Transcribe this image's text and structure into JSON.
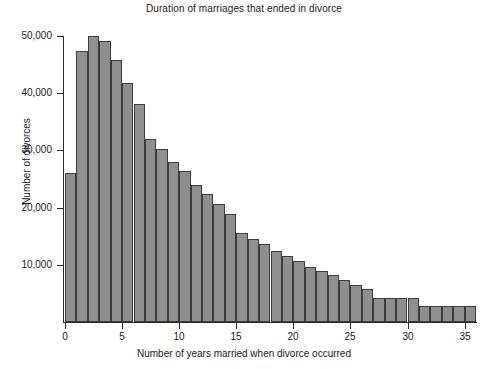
{
  "chart_data": {
    "type": "bar",
    "title": "Duration of marriages that ended in divorce",
    "xlabel": "Number of years married when divorce occurred",
    "ylabel": "Number of divorces",
    "grid": false,
    "legend": null,
    "xlim": [
      0,
      36
    ],
    "ylim": [
      0,
      50000
    ],
    "bin_width": 1,
    "x_ticks": [
      0,
      5,
      10,
      15,
      20,
      25,
      30,
      35
    ],
    "x_tick_labels": [
      "0",
      "5",
      "10",
      "15",
      "20",
      "25",
      "30",
      "35"
    ],
    "y_ticks": [
      10000,
      20000,
      30000,
      40000,
      50000
    ],
    "y_tick_labels": [
      "10,000",
      "20,000",
      "30,000",
      "40,000",
      "50,000"
    ],
    "bar_color": "#8f8f8f",
    "bar_edge_color": "#3c3c3c",
    "axis_color": "#2b2b2b",
    "background_color": "#ffffff",
    "categories": [
      "0-1",
      "1-2",
      "2-3",
      "3-4",
      "4-5",
      "5-6",
      "6-7",
      "7-8",
      "8-9",
      "9-10",
      "10-11",
      "11-12",
      "12-13",
      "13-14",
      "14-15",
      "15-16",
      "16-17",
      "17-18",
      "18-19",
      "19-20",
      "20-21",
      "21-22",
      "22-23",
      "23-24",
      "24-25",
      "25-26",
      "26-27",
      "27-28",
      "28-29",
      "29-30",
      "30-31",
      "31-32",
      "32-33",
      "33-34",
      "34-35",
      "35-36"
    ],
    "bin_starts": [
      0,
      1,
      2,
      3,
      4,
      5,
      6,
      7,
      8,
      9,
      10,
      11,
      12,
      13,
      14,
      15,
      16,
      17,
      18,
      19,
      20,
      21,
      22,
      23,
      24,
      25,
      26,
      27,
      28,
      29,
      30,
      31,
      32,
      33,
      34,
      35
    ],
    "values": [
      26000,
      47400,
      50000,
      49100,
      45800,
      41800,
      38200,
      32000,
      30200,
      28000,
      26400,
      24000,
      22400,
      20600,
      18800,
      15600,
      14600,
      13600,
      12400,
      11600,
      10600,
      9600,
      9000,
      8200,
      7400,
      6400,
      5800,
      4200,
      4200,
      4200,
      4200,
      2800,
      2800,
      2800,
      2800,
      2800
    ]
  }
}
